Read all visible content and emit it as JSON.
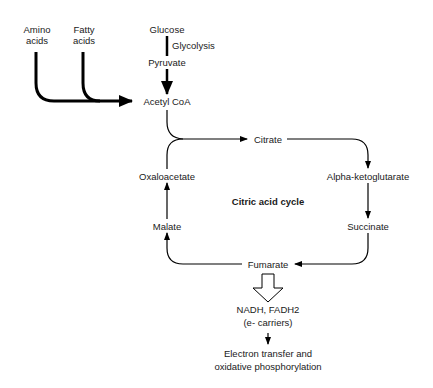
{
  "diagram": {
    "title": "Citric acid cycle",
    "inputs": {
      "amino_acids": [
        "Amino",
        "acids"
      ],
      "fatty_acids": [
        "Fatty",
        "acids"
      ],
      "glucose": "Glucose",
      "glycolysis": "Glycolysis",
      "pyruvate": "Pyruvate",
      "acetyl_coa": "Acetyl CoA"
    },
    "cycle": {
      "citrate": "Citrate",
      "alpha_ketoglutarate": "Alpha-ketoglutarate",
      "succinate": "Succinate",
      "fumarate": "Fumarate",
      "malate": "Malate",
      "oxaloacetate": "Oxaloacetate"
    },
    "outputs": {
      "carriers": "NADH, FADH2",
      "carriers_note": "(e- carriers)",
      "final_line1": "Electron transfer and",
      "final_line2": "oxidative phosphorylation"
    },
    "colors": {
      "stroke": "#000000",
      "background": "#ffffff"
    }
  }
}
